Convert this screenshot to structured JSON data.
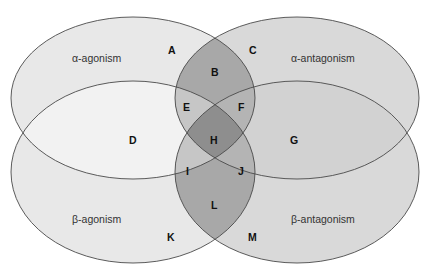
{
  "diagram": {
    "type": "four-set venn diagram",
    "sets": [
      {
        "id": "alpha_agonism",
        "label": "α-agonism"
      },
      {
        "id": "alpha_antagonism",
        "label": "α-antagonism"
      },
      {
        "id": "beta_agonism",
        "label": "β-agonism"
      },
      {
        "id": "beta_antagonism",
        "label": "β-antagonism"
      }
    ],
    "regions": [
      {
        "letter": "A",
        "sets": [
          "alpha_agonism"
        ]
      },
      {
        "letter": "B",
        "sets": [
          "alpha_agonism",
          "alpha_antagonism"
        ]
      },
      {
        "letter": "C",
        "sets": [
          "alpha_antagonism"
        ]
      },
      {
        "letter": "D",
        "sets": [
          "alpha_agonism",
          "beta_agonism"
        ]
      },
      {
        "letter": "E",
        "sets": [
          "alpha_agonism",
          "alpha_antagonism",
          "beta_agonism"
        ]
      },
      {
        "letter": "F",
        "sets": [
          "alpha_agonism",
          "alpha_antagonism",
          "beta_antagonism"
        ]
      },
      {
        "letter": "G",
        "sets": [
          "alpha_antagonism",
          "beta_antagonism"
        ]
      },
      {
        "letter": "H",
        "sets": [
          "alpha_agonism",
          "alpha_antagonism",
          "beta_agonism",
          "beta_antagonism"
        ]
      },
      {
        "letter": "I",
        "sets": [
          "alpha_agonism",
          "beta_agonism",
          "beta_antagonism"
        ]
      },
      {
        "letter": "J",
        "sets": [
          "alpha_antagonism",
          "beta_agonism",
          "beta_antagonism"
        ]
      },
      {
        "letter": "K",
        "sets": [
          "beta_agonism"
        ]
      },
      {
        "letter": "L",
        "sets": [
          "beta_agonism",
          "beta_antagonism"
        ]
      },
      {
        "letter": "M",
        "sets": [
          "beta_antagonism"
        ]
      }
    ],
    "colors": {
      "background": "#ffffff",
      "outline": "#4a4a4a",
      "light": "#e9e9e9",
      "lightest": "#f3f3f3",
      "medium": "#d6d6d6",
      "dark": "#a9a9a9",
      "darker": "#8f8f8f",
      "lens_light": "#c4c4c4"
    }
  }
}
